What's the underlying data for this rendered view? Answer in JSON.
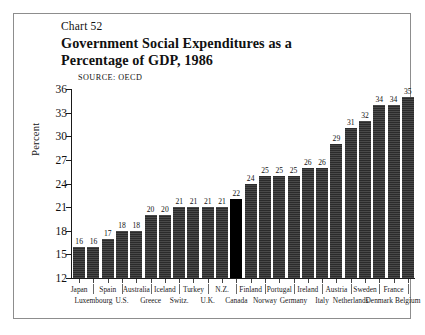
{
  "figure": {
    "chart_number": "Chart 52",
    "title": "Government Social Expenditures as a Percentage of GDP, 1986",
    "source": "SOURCE: OECD",
    "frame_color": "#8d8d8d",
    "background": "#ffffff"
  },
  "chart_data": {
    "type": "bar",
    "title": "Government Social Expenditures as a Percentage of GDP, 1986",
    "subtitle": "Chart 52",
    "source": "SOURCE: OECD",
    "xlabel": "",
    "ylabel": "Percent",
    "ylim": [
      12,
      36
    ],
    "yticks": [
      12,
      15,
      18,
      21,
      24,
      27,
      30,
      33,
      36
    ],
    "grid": false,
    "legend": null,
    "bar_color": "#2b2b2b",
    "highlight_color": "#000000",
    "highlight_category": "Canada",
    "categories": [
      "Japan",
      "Luxembourg",
      "Spain",
      "U.S.",
      "Australia",
      "Greece",
      "Iceland",
      "Switz.",
      "Turkey",
      "U.K.",
      "N.Z.",
      "Canada",
      "Finland",
      "Norway",
      "Portugal",
      "Germany",
      "Ireland",
      "Italy",
      "Austria",
      "Netherlands",
      "Sweden",
      "Denmark",
      "France",
      "Belgium"
    ],
    "values": [
      16,
      16,
      17,
      18,
      18,
      20,
      20,
      21,
      21,
      21,
      21,
      22,
      24,
      25,
      25,
      25,
      26,
      26,
      29,
      31,
      32,
      34,
      34,
      35
    ],
    "label_rows": {
      "top": [
        "Japan",
        "Spain",
        "Australia",
        "Iceland",
        "Turkey",
        "N.Z.",
        "Finland",
        "Portugal",
        "Ireland",
        "Austria",
        "Sweden",
        "France"
      ],
      "bottom": [
        "Luxembourg",
        "U.S.",
        "Greece",
        "Switz.",
        "U.K.",
        "Canada",
        "Norway",
        "Germany",
        "Italy",
        "Netherlands",
        "Denmark",
        "Belgium"
      ]
    }
  }
}
